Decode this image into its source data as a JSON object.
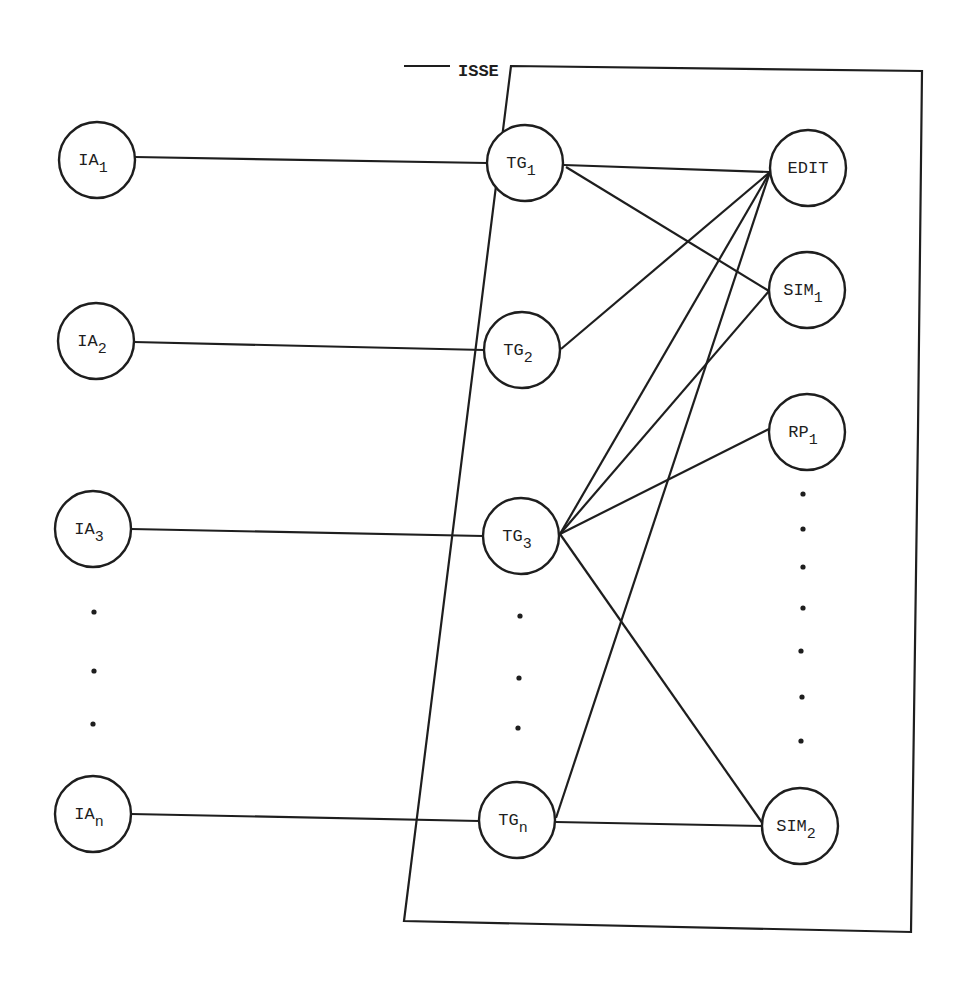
{
  "diagram": {
    "boundary": {
      "label": "ISSE",
      "label_x": 458,
      "label_y": 76,
      "points": "404,66 450,66 M 511,66 L 922,71 L 918,430 L 911,932 L 404,921 Z",
      "label_gap": [
        450,
        511
      ]
    },
    "nodes": [
      {
        "id": "IA1",
        "base": "IA",
        "sub": "1",
        "cx": 97,
        "cy": 160,
        "r": 38
      },
      {
        "id": "IA2",
        "base": "IA",
        "sub": "2",
        "cx": 96,
        "cy": 341,
        "r": 38
      },
      {
        "id": "IA3",
        "base": "IA",
        "sub": "3",
        "cx": 93,
        "cy": 529,
        "r": 38
      },
      {
        "id": "IAn",
        "base": "IA",
        "sub": "n",
        "cx": 93,
        "cy": 814,
        "r": 38
      },
      {
        "id": "TG1",
        "base": "TG",
        "sub": "1",
        "cx": 525,
        "cy": 163,
        "r": 38
      },
      {
        "id": "TG2",
        "base": "TG",
        "sub": "2",
        "cx": 522,
        "cy": 350,
        "r": 38
      },
      {
        "id": "TG3",
        "base": "TG",
        "sub": "3",
        "cx": 521,
        "cy": 536,
        "r": 38
      },
      {
        "id": "TGn",
        "base": "TG",
        "sub": "n",
        "cx": 517,
        "cy": 820,
        "r": 38
      },
      {
        "id": "EDIT",
        "base": "EDIT",
        "sub": "",
        "cx": 808,
        "cy": 168,
        "r": 38
      },
      {
        "id": "SIM1",
        "base": "SIM",
        "sub": "1",
        "cx": 807,
        "cy": 290,
        "r": 38
      },
      {
        "id": "RP1",
        "base": "RP",
        "sub": "1",
        "cx": 807,
        "cy": 432,
        "r": 38
      },
      {
        "id": "SIM2",
        "base": "SIM",
        "sub": "2",
        "cx": 800,
        "cy": 826,
        "r": 38
      }
    ],
    "edges": [
      {
        "from": "IA1",
        "to": "TG1",
        "x1": 135,
        "y1": 157,
        "x2": 487,
        "y2": 163
      },
      {
        "from": "IA2",
        "to": "TG2",
        "x1": 134,
        "y1": 342,
        "x2": 484,
        "y2": 350
      },
      {
        "from": "IA3",
        "to": "TG3",
        "x1": 131,
        "y1": 529,
        "x2": 483,
        "y2": 536
      },
      {
        "from": "IAn",
        "to": "TGn",
        "x1": 131,
        "y1": 814,
        "x2": 479,
        "y2": 821
      },
      {
        "from": "TG1",
        "to": "EDIT",
        "x1": 564,
        "y1": 165,
        "x2": 770,
        "y2": 172
      },
      {
        "from": "TG1",
        "to": "SIM1",
        "x1": 566,
        "y1": 167,
        "x2": 769,
        "y2": 291
      },
      {
        "from": "TG2",
        "to": "EDIT",
        "x1": 561,
        "y1": 349,
        "x2": 770,
        "y2": 172
      },
      {
        "from": "TG3",
        "to": "EDIT",
        "x1": 560,
        "y1": 534,
        "x2": 770,
        "y2": 172
      },
      {
        "from": "TG3",
        "to": "SIM1",
        "x1": 560,
        "y1": 534,
        "x2": 769,
        "y2": 291
      },
      {
        "from": "TG3",
        "to": "RP1",
        "x1": 560,
        "y1": 534,
        "x2": 769,
        "y2": 429
      },
      {
        "from": "TG3",
        "to": "SIM2",
        "x1": 560,
        "y1": 534,
        "x2": 763,
        "y2": 824
      },
      {
        "from": "TGn",
        "to": "EDIT",
        "x1": 556,
        "y1": 818,
        "x2": 770,
        "y2": 172
      },
      {
        "from": "TGn",
        "to": "SIM2",
        "x1": 556,
        "y1": 822,
        "x2": 762,
        "y2": 826
      }
    ],
    "ellipsis_dots": {
      "ia_column": [
        [
          94,
          612
        ],
        [
          94,
          671
        ],
        [
          93,
          724
        ]
      ],
      "tg_column": [
        [
          520,
          616
        ],
        [
          519,
          678
        ],
        [
          518,
          728
        ]
      ],
      "right_column": [
        [
          803,
          494
        ],
        [
          803,
          529
        ],
        [
          803,
          567
        ],
        [
          803,
          608
        ],
        [
          801,
          651
        ],
        [
          802,
          697
        ],
        [
          801,
          741
        ]
      ]
    }
  }
}
